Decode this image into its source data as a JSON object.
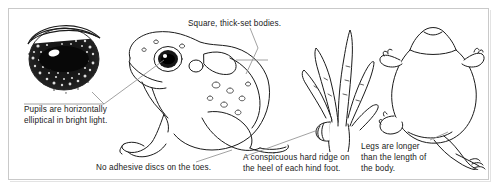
{
  "plate": {
    "title": "Toad identification features",
    "background_color": "#ffffff",
    "border_color": "#c9c9c9",
    "ink_color": "#1b1b1b",
    "leader_color": "#8a8a8a"
  },
  "figures": [
    {
      "id": "eye-closeup",
      "name": "toad-eye-closeup",
      "description": "Close-up of toad eye with horizontally elliptical black pupil, speckled iris and upper eyelid arc"
    },
    {
      "id": "toad-side",
      "name": "toad-side-view",
      "description": "Side view line drawing of a squat thick-set toad facing left"
    },
    {
      "id": "hind-foot",
      "name": "toad-hind-foot",
      "description": "Detail of hind foot showing toes and a conspicuous hard ridge on the heel"
    },
    {
      "id": "toad-top",
      "name": "toad-top-view",
      "description": "Top view line drawing of a toad with one hind leg extended backwards"
    }
  ],
  "captions": [
    {
      "id": "pupils",
      "text": "Pupils are horizontally\nelliptical in bright light."
    },
    {
      "id": "bodies",
      "text": "Square, thick-set bodies."
    },
    {
      "id": "toes",
      "text": "No adhesive discs on the toes."
    },
    {
      "id": "heel-ridge",
      "text": "A conspicuous hard ridge on\nthe heel of each hind foot."
    },
    {
      "id": "legs",
      "text": "Legs are longer\nthan the length of\nthe body."
    }
  ]
}
